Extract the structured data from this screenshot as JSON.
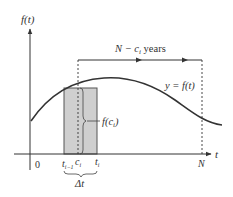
{
  "diagram": {
    "axes": {
      "y_label": "f(t)",
      "x_label": "t",
      "origin_label": "0"
    },
    "curve_label": "y = f(t)",
    "span_label": {
      "prefix": "N − c",
      "subscript": "i",
      "suffix": " years"
    },
    "rect_height_label": {
      "prefix": "f(c",
      "subscript": "i",
      "suffix": ")"
    },
    "x_ticks": {
      "t_prev": {
        "base": "t",
        "sub": "i−1"
      },
      "c_i": {
        "base": "c",
        "sub": "i"
      },
      "t_i": {
        "base": "t",
        "sub": "i"
      },
      "N": "N"
    },
    "width_label": "Δt",
    "colors": {
      "line": "#333333",
      "rect_fill": "#cfcfcf",
      "rect_stroke": "#444444",
      "background": "#ffffff"
    }
  }
}
